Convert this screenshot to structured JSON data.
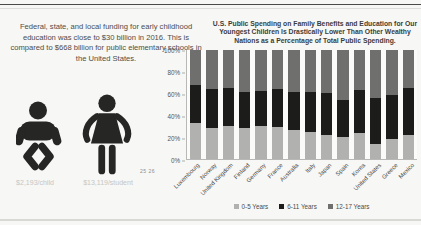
{
  "page": {
    "top_heading": "Selected Nations"
  },
  "left_panel": {
    "paragraph": "Federal, state, and local funding for early childhood education was close to $30 billion in 2016. This is compared to $668 billion for public elementary schools in the United States.",
    "child_cost_label": "$2,193/child",
    "student_cost_label": "$13,119/student",
    "footnote_refs": "25 26"
  },
  "chart_data": {
    "type": "bar",
    "stacked": true,
    "title": "U.S. Public Spending on Family Benefits and Education for Our Youngest Children Is Drastically Lower Than Other Wealthy Nations as a Percentage of Total Public Spending.",
    "categories": [
      "Luxembourg",
      "Norway",
      "United Kingdom",
      "Finland",
      "Germany",
      "France",
      "Australia",
      "Italy",
      "Japan",
      "Spain",
      "Korea",
      "United States",
      "Greece",
      "Mexico"
    ],
    "series": [
      {
        "name": "0-5 Years",
        "color": "#b1b1af",
        "values": [
          33,
          29,
          31,
          29,
          31,
          30,
          27,
          25,
          22,
          21,
          24,
          14,
          19,
          22
        ]
      },
      {
        "name": "6-11 Years",
        "color": "#1c1c1a",
        "values": [
          35,
          36,
          35,
          33,
          32,
          35,
          35,
          37,
          39,
          34,
          40,
          42,
          40,
          44
        ]
      },
      {
        "name": "12-17 Years",
        "color": "#6f6f6d",
        "values": [
          32,
          35,
          34,
          38,
          37,
          35,
          38,
          38,
          39,
          45,
          36,
          44,
          41,
          34
        ]
      }
    ],
    "xlabel": "",
    "ylabel": "",
    "ylim": [
      0,
      100
    ],
    "yticks": [
      "0%",
      "20%",
      "40%",
      "60%",
      "80%",
      "100%"
    ],
    "grid": false,
    "legend_position": "bottom"
  }
}
